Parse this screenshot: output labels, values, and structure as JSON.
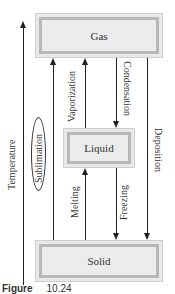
{
  "diagram": {
    "states": {
      "gas": "Gas",
      "liquid": "Liquid",
      "solid": "Solid"
    },
    "axis_label": "Temperature",
    "transitions": {
      "sublimation": "Sublimation",
      "vaporization": "Vaporization",
      "condensation": "Condensation",
      "deposition": "Deposition",
      "melting": "Melting",
      "freezing": "Freezing"
    },
    "colors": {
      "box_fill": "#ececec",
      "box_border": "#b8b8b8",
      "arrow": "#222222"
    }
  },
  "caption": {
    "label": "Figure",
    "number": "10.24"
  }
}
